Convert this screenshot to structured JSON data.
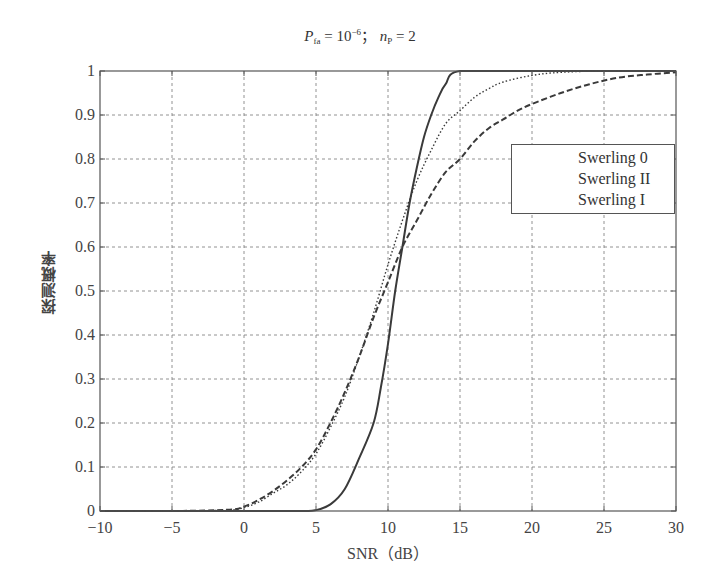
{
  "chart_data": {
    "type": "line",
    "title_parts": {
      "p": "P",
      "p_sub": "fa",
      "eq1": " = 10",
      "exp": "−6",
      "sep": "；  ",
      "n": "n",
      "n_sub": "P",
      "eq2": " = 2"
    },
    "xlabel": "SNR（dB）",
    "ylabel": "探测概率",
    "xlim": [
      -10,
      30
    ],
    "ylim": [
      0,
      1
    ],
    "xticks": [
      -10,
      -5,
      0,
      5,
      10,
      15,
      20,
      25,
      30
    ],
    "xtick_labels": [
      "−10",
      "−5",
      "0",
      "5",
      "10",
      "15",
      "20",
      "25",
      "30"
    ],
    "yticks": [
      0,
      0.1,
      0.2,
      0.3,
      0.4,
      0.5,
      0.6,
      0.7,
      0.8,
      0.9,
      1
    ],
    "ytick_labels": [
      "0",
      "0.1",
      "0.2",
      "0.3",
      "0.4",
      "0.5",
      "0.6",
      "0.7",
      "0.8",
      "0.9",
      "1"
    ],
    "grid": true,
    "legend_position": "upper right",
    "series": [
      {
        "name": "Swerling 0",
        "style": "solid",
        "x": [
          -10,
          -5,
          0,
          4,
          5,
          6,
          7,
          8,
          9,
          9.5,
          10,
          10.5,
          11,
          11.5,
          12,
          12.5,
          13,
          13.5,
          14,
          15,
          20,
          30
        ],
        "y": [
          0,
          0,
          0,
          0,
          0.002,
          0.015,
          0.05,
          0.12,
          0.2,
          0.28,
          0.38,
          0.5,
          0.6,
          0.7,
          0.78,
          0.85,
          0.9,
          0.94,
          0.97,
          1.0,
          1.0,
          1.0
        ]
      },
      {
        "name": "Swerling II",
        "style": "dotted",
        "x": [
          -10,
          -5,
          -1,
          0,
          1,
          2,
          3,
          4,
          5,
          6,
          7,
          8,
          9,
          10,
          11,
          12,
          13,
          14,
          15,
          16,
          17,
          18,
          20,
          22,
          25,
          30
        ],
        "y": [
          0,
          0,
          0.002,
          0.008,
          0.02,
          0.04,
          0.06,
          0.09,
          0.13,
          0.19,
          0.26,
          0.35,
          0.45,
          0.56,
          0.66,
          0.75,
          0.82,
          0.88,
          0.91,
          0.94,
          0.96,
          0.975,
          0.99,
          0.997,
          1.0,
          1.0
        ]
      },
      {
        "name": "Swerling I",
        "style": "dashed",
        "x": [
          -10,
          -5,
          -1,
          0,
          1,
          2,
          3,
          4,
          5,
          6,
          7,
          8,
          9,
          10,
          11,
          12,
          13,
          14,
          15,
          16,
          17,
          18,
          19,
          20,
          22,
          24,
          26,
          28,
          30
        ],
        "y": [
          0,
          0,
          0.003,
          0.01,
          0.025,
          0.045,
          0.07,
          0.1,
          0.14,
          0.2,
          0.27,
          0.35,
          0.44,
          0.52,
          0.6,
          0.66,
          0.72,
          0.77,
          0.8,
          0.84,
          0.87,
          0.89,
          0.91,
          0.925,
          0.95,
          0.97,
          0.985,
          0.992,
          0.997
        ]
      }
    ]
  },
  "legend": {
    "items": [
      {
        "label": "Swerling 0",
        "style": "solid"
      },
      {
        "label": "Swerling II",
        "style": "dotted"
      },
      {
        "label": "Swerling I",
        "style": "dashed"
      }
    ]
  },
  "colors": {
    "line": "#3a3a3a",
    "grid": "#777777",
    "axis": "#555555"
  }
}
